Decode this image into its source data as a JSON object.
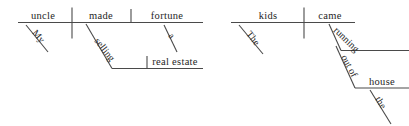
{
  "figure": {
    "type": "sentence-diagram",
    "background_color": "#ffffff",
    "line_color": "#4a4a4a",
    "text_color": "#262626"
  },
  "diagrams": [
    {
      "id": "diagram-left",
      "sentence": "My uncle made a fortune selling real estate",
      "words": {
        "subject": "uncle",
        "verb": "made",
        "object": "fortune",
        "subject_modifier": "My",
        "object_modifier": "a",
        "gerund": "selling",
        "gerund_object": "real estate"
      }
    },
    {
      "id": "diagram-right",
      "sentence": "The kids came running out of the house",
      "words": {
        "subject": "kids",
        "verb": "came",
        "subject_modifier": "The",
        "participle": "running",
        "preposition": "out of",
        "prep_object": "house",
        "prep_object_modifier": "the"
      }
    }
  ]
}
